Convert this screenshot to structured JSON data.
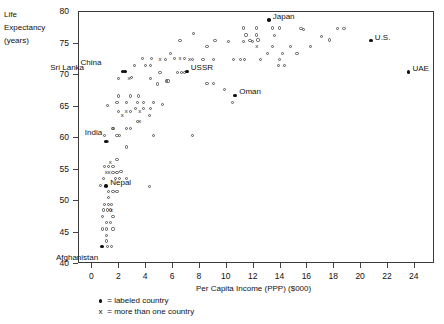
{
  "chart_data": {
    "type": "scatter",
    "title": "",
    "xlabel": "Per Capita Income (PPP) ($000)",
    "ylabel_lines": [
      "Life",
      "Expectancy",
      "(years)"
    ],
    "xlim": [
      -1,
      25.5
    ],
    "ylim": [
      40,
      80
    ],
    "xticks": [
      0,
      2,
      4,
      6,
      8,
      10,
      12,
      14,
      16,
      18,
      20,
      22,
      24
    ],
    "yticks": [
      40,
      45,
      50,
      55,
      60,
      65,
      70,
      75,
      80
    ],
    "grid": false,
    "legend_position": "below-axis-left",
    "legend": [
      {
        "symbol": "dot",
        "text": "= labeled country"
      },
      {
        "symbol": "x",
        "text": "= more than one country"
      }
    ],
    "labeled_points": [
      {
        "name": "Japan",
        "x": 13.2,
        "y": 78.6,
        "label_dx": 4,
        "label_dy": -4
      },
      {
        "name": "U.S.",
        "x": 20.8,
        "y": 75.3,
        "label_dx": 4,
        "label_dy": -4
      },
      {
        "name": "UAE",
        "x": 23.6,
        "y": 70.3,
        "label_dx": 4,
        "label_dy": -4
      },
      {
        "name": "Oman",
        "x": 10.7,
        "y": 66.6,
        "label_dx": 4,
        "label_dy": -4
      },
      {
        "name": "China",
        "x": 2.3,
        "y": 70.4,
        "label_dx": -21,
        "label_dy": -9
      },
      {
        "name": "Sri Lanka",
        "x": 2.5,
        "y": 70.4,
        "label_dx": -41,
        "label_dy": -4
      },
      {
        "name": "USSR",
        "x": 7.1,
        "y": 70.4,
        "label_dx": 4,
        "label_dy": -4
      },
      {
        "name": "India",
        "x": 1.1,
        "y": 59.3,
        "label_dx": -4,
        "label_dy": -9
      },
      {
        "name": "Nepal",
        "x": 1.1,
        "y": 52.2,
        "label_dx": 4,
        "label_dy": -4
      },
      {
        "name": "Afghanistan",
        "x": 0.8,
        "y": 42.6,
        "label_dx": -4,
        "label_dy": 10
      }
    ],
    "open_points": [
      {
        "x": 7.6,
        "y": 76.4
      },
      {
        "x": 6.6,
        "y": 75.3
      },
      {
        "x": 12.4,
        "y": 75.4
      },
      {
        "x": 15.8,
        "y": 77.1
      },
      {
        "x": 17.1,
        "y": 76.0
      },
      {
        "x": 17.7,
        "y": 75.4
      },
      {
        "x": 11.3,
        "y": 77.3
      },
      {
        "x": 12.3,
        "y": 77.3
      },
      {
        "x": 13.5,
        "y": 77.3
      },
      {
        "x": 14.0,
        "y": 77.3
      },
      {
        "x": 15.6,
        "y": 77.2
      },
      {
        "x": 18.3,
        "y": 77.2
      },
      {
        "x": 18.8,
        "y": 77.2
      },
      {
        "x": 11.5,
        "y": 76.2
      },
      {
        "x": 12.3,
        "y": 76.2
      },
      {
        "x": 13.6,
        "y": 76.1
      },
      {
        "x": 5.9,
        "y": 73.3
      },
      {
        "x": 8.6,
        "y": 74.4
      },
      {
        "x": 11.8,
        "y": 75.3
      },
      {
        "x": 13.5,
        "y": 74.3
      },
      {
        "x": 14.8,
        "y": 74.3
      },
      {
        "x": 9.2,
        "y": 75.3
      },
      {
        "x": 10.2,
        "y": 75.2
      },
      {
        "x": 16.3,
        "y": 74.4
      },
      {
        "x": 7.5,
        "y": 72.3
      },
      {
        "x": 8.3,
        "y": 72.3
      },
      {
        "x": 9.1,
        "y": 72.3
      },
      {
        "x": 10.6,
        "y": 72.3
      },
      {
        "x": 11.1,
        "y": 72.3
      },
      {
        "x": 11.4,
        "y": 72.3
      },
      {
        "x": 12.6,
        "y": 72.3
      },
      {
        "x": 14.0,
        "y": 72.3
      },
      {
        "x": 11.3,
        "y": 75.2
      },
      {
        "x": 12.0,
        "y": 75.2
      },
      {
        "x": 13.1,
        "y": 73.2
      },
      {
        "x": 14.2,
        "y": 73.2
      },
      {
        "x": 15.3,
        "y": 73.2
      },
      {
        "x": 4.4,
        "y": 71.4
      },
      {
        "x": 5.5,
        "y": 72.3
      },
      {
        "x": 6.2,
        "y": 72.4
      },
      {
        "x": 6.9,
        "y": 72.4
      },
      {
        "x": 3.8,
        "y": 72.4
      },
      {
        "x": 4.5,
        "y": 72.4
      },
      {
        "x": 3.2,
        "y": 71.4
      },
      {
        "x": 4.0,
        "y": 71.3
      },
      {
        "x": 5.1,
        "y": 70.3
      },
      {
        "x": 6.4,
        "y": 70.3
      },
      {
        "x": 6.7,
        "y": 70.3
      },
      {
        "x": 6.9,
        "y": 70.3
      },
      {
        "x": 2.0,
        "y": 69.3
      },
      {
        "x": 4.4,
        "y": 69.3
      },
      {
        "x": 5.6,
        "y": 68.9
      },
      {
        "x": 5.7,
        "y": 68.9
      },
      {
        "x": 4.9,
        "y": 68.4
      },
      {
        "x": 2.0,
        "y": 66.5
      },
      {
        "x": 2.9,
        "y": 66.5
      },
      {
        "x": 3.5,
        "y": 66.5
      },
      {
        "x": 1.9,
        "y": 65.5
      },
      {
        "x": 2.6,
        "y": 65.5
      },
      {
        "x": 3.4,
        "y": 65.5
      },
      {
        "x": 3.9,
        "y": 65.5
      },
      {
        "x": 4.6,
        "y": 65.5
      },
      {
        "x": 1.2,
        "y": 65.0
      },
      {
        "x": 5.3,
        "y": 65.1
      },
      {
        "x": 3.3,
        "y": 64.5
      },
      {
        "x": 3.9,
        "y": 64.5
      },
      {
        "x": 4.4,
        "y": 64.5
      },
      {
        "x": 2.0,
        "y": 64.0
      },
      {
        "x": 2.9,
        "y": 64.0
      },
      {
        "x": 4.3,
        "y": 63.4
      },
      {
        "x": 3.4,
        "y": 62.4
      },
      {
        "x": 1.6,
        "y": 61.3
      },
      {
        "x": 2.6,
        "y": 61.3
      },
      {
        "x": 2.9,
        "y": 61.3
      },
      {
        "x": 1.0,
        "y": 60.3
      },
      {
        "x": 2.1,
        "y": 60.2
      },
      {
        "x": 4.6,
        "y": 60.3
      },
      {
        "x": 7.5,
        "y": 60.3
      },
      {
        "x": 1.9,
        "y": 60.3
      },
      {
        "x": 1.2,
        "y": 59.3
      },
      {
        "x": 2.6,
        "y": 58.4
      },
      {
        "x": 1.9,
        "y": 56.4
      },
      {
        "x": 1.0,
        "y": 55.3
      },
      {
        "x": 1.3,
        "y": 55.3
      },
      {
        "x": 1.6,
        "y": 55.3
      },
      {
        "x": 2.2,
        "y": 54.5
      },
      {
        "x": 1.6,
        "y": 54.4
      },
      {
        "x": 1.9,
        "y": 54.4
      },
      {
        "x": 0.9,
        "y": 53.4
      },
      {
        "x": 1.8,
        "y": 53.4
      },
      {
        "x": 2.1,
        "y": 53.4
      },
      {
        "x": 2.6,
        "y": 53.4
      },
      {
        "x": 0.7,
        "y": 52.3
      },
      {
        "x": 4.3,
        "y": 52.2
      },
      {
        "x": 1.3,
        "y": 51.3
      },
      {
        "x": 1.6,
        "y": 51.3
      },
      {
        "x": 1.9,
        "y": 51.3
      },
      {
        "x": 1.3,
        "y": 50.4
      },
      {
        "x": 1.0,
        "y": 49.3
      },
      {
        "x": 1.3,
        "y": 49.3
      },
      {
        "x": 1.5,
        "y": 49.3
      },
      {
        "x": 0.9,
        "y": 48.4
      },
      {
        "x": 1.2,
        "y": 48.4
      },
      {
        "x": 1.4,
        "y": 48.4
      },
      {
        "x": 0.8,
        "y": 47.4
      },
      {
        "x": 1.6,
        "y": 47.4
      },
      {
        "x": 1.1,
        "y": 46.4
      },
      {
        "x": 1.4,
        "y": 46.4
      },
      {
        "x": 0.8,
        "y": 45.4
      },
      {
        "x": 1.1,
        "y": 45.4
      },
      {
        "x": 1.6,
        "y": 45.4
      },
      {
        "x": 1.1,
        "y": 44.4
      },
      {
        "x": 1.1,
        "y": 43.5
      },
      {
        "x": 1.2,
        "y": 42.6
      },
      {
        "x": 1.5,
        "y": 42.6
      },
      {
        "x": 10.5,
        "y": 65.5
      },
      {
        "x": 8.6,
        "y": 68.5
      },
      {
        "x": 9.1,
        "y": 68.5
      },
      {
        "x": 9.9,
        "y": 67.5
      },
      {
        "x": 13.9,
        "y": 71.3
      },
      {
        "x": 14.4,
        "y": 71.3
      },
      {
        "x": 3.0,
        "y": 69.4
      }
    ],
    "x_points": [
      {
        "x": 2.8,
        "y": 69.3
      },
      {
        "x": 5.1,
        "y": 72.3
      },
      {
        "x": 7.3,
        "y": 72.3
      },
      {
        "x": 2.6,
        "y": 64.0
      },
      {
        "x": 3.6,
        "y": 64.0
      },
      {
        "x": 2.3,
        "y": 63.4
      },
      {
        "x": 3.6,
        "y": 62.4
      },
      {
        "x": 1.6,
        "y": 61.3
      },
      {
        "x": 1.4,
        "y": 55.9
      },
      {
        "x": 1.1,
        "y": 54.4
      },
      {
        "x": 1.3,
        "y": 54.4
      },
      {
        "x": 1.5,
        "y": 48.4
      },
      {
        "x": 12.3,
        "y": 74.3
      },
      {
        "x": 6.6,
        "y": 72.4
      }
    ]
  }
}
